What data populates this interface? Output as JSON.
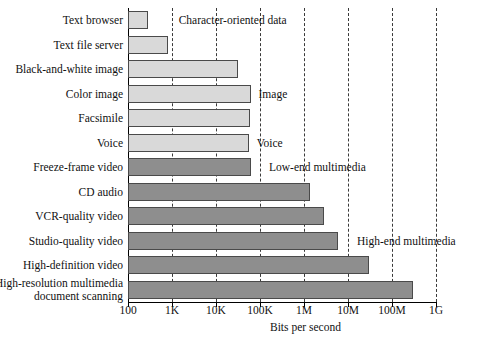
{
  "chart_data": {
    "type": "bar",
    "orientation": "horizontal",
    "title": "",
    "xlabel": "Bits per second",
    "ylabel": "",
    "xscale": "log",
    "xlim": [
      100,
      1000000000
    ],
    "grid": true,
    "legend": "none",
    "xticks": [
      {
        "value": 100,
        "label": "100"
      },
      {
        "value": 1000,
        "label": "1K"
      },
      {
        "value": 10000,
        "label": "10K"
      },
      {
        "value": 100000,
        "label": "100K"
      },
      {
        "value": 1000000,
        "label": "1M"
      },
      {
        "value": 10000000,
        "label": "10M"
      },
      {
        "value": 100000000,
        "label": "100M"
      },
      {
        "value": 1000000000,
        "label": "1G"
      }
    ],
    "categories": [
      "Text browser",
      "Text file server",
      "Black-and-white image",
      "Color image",
      "Facsimile",
      "Voice",
      "Freeze-frame video",
      "CD audio",
      "VCR-quality video",
      "Studio-quality video",
      "High-definition video",
      "High-resolution multimedia\ndocument scanning"
    ],
    "values": [
      290,
      800,
      32000,
      63000,
      58000,
      56000,
      64000,
      1400000,
      2800000,
      6000000,
      30000000,
      300000000
    ],
    "bar_styles": [
      "light",
      "light",
      "light",
      "light",
      "light",
      "light",
      "dark",
      "dark",
      "dark",
      "dark",
      "dark",
      "dark"
    ],
    "annotations": [
      {
        "text": "Character-oriented data",
        "x": 1150,
        "row": 0
      },
      {
        "text": "Image",
        "x": 75000,
        "row": 3
      },
      {
        "text": "Voice",
        "x": 68000,
        "row": 5
      },
      {
        "text": "Low-end multimedia",
        "x": 130000,
        "row": 6
      },
      {
        "text": "High-end multimedia",
        "x": 13000000,
        "row": 9
      }
    ],
    "colors": {
      "bar_light": "#d9d9d9",
      "bar_dark": "#8e8e8e",
      "bar_edge": "#4a4a4a",
      "axis": "#000000",
      "gridline": "#3a3a3a",
      "background": "#ffffff",
      "text": "#111111"
    }
  }
}
